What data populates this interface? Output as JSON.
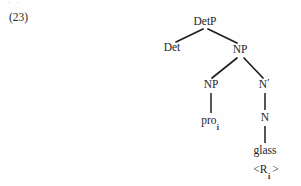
{
  "figure": {
    "example_number": "(23)",
    "scan_remnant": "· ·",
    "ink_color": "#1f1f1f",
    "page_background": "#fefefe"
  },
  "tree": {
    "type": "syntax-tree",
    "root": "DetP",
    "nodes": [
      {
        "id": "detp",
        "label": "DetP",
        "x": 205,
        "y": 22,
        "kind": "nonterminal"
      },
      {
        "id": "det",
        "label": "Det",
        "x": 172,
        "y": 48,
        "kind": "nonterminal"
      },
      {
        "id": "np1",
        "label": "NP",
        "x": 240,
        "y": 50,
        "kind": "nonterminal"
      },
      {
        "id": "np2",
        "label": "NP",
        "x": 211,
        "y": 85,
        "kind": "nonterminal"
      },
      {
        "id": "nbar",
        "label": "N",
        "x": 264,
        "y": 85,
        "kind": "nonterminal",
        "prime": "′"
      },
      {
        "id": "pro",
        "label": "pro",
        "x": 210,
        "y": 121,
        "kind": "terminal",
        "subscript": "i"
      },
      {
        "id": "n",
        "label": "N",
        "x": 265,
        "y": 118,
        "kind": "nonterminal"
      },
      {
        "id": "glass",
        "label": "glass",
        "x": 265,
        "y": 151,
        "kind": "terminal"
      },
      {
        "id": "rindex",
        "label": "<R",
        "x": 266,
        "y": 170,
        "kind": "annotation",
        "subscript": "i",
        "closing": ">"
      }
    ],
    "edges": [
      {
        "from": "detp",
        "to": "det",
        "x1": 203,
        "y1": 29,
        "x2": 176,
        "y2": 42,
        "style": "diagonal"
      },
      {
        "from": "detp",
        "to": "np1",
        "x1": 208,
        "y1": 29,
        "x2": 237,
        "y2": 43,
        "style": "diagonal"
      },
      {
        "from": "np1",
        "to": "np2",
        "x1": 237,
        "y1": 58,
        "x2": 212,
        "y2": 78,
        "style": "diagonal"
      },
      {
        "from": "np1",
        "to": "nbar",
        "x1": 244,
        "y1": 58,
        "x2": 263,
        "y2": 78,
        "style": "diagonal"
      },
      {
        "from": "np2",
        "to": "pro",
        "x1": 211,
        "y1": 93,
        "x2": 211,
        "y2": 113,
        "style": "vertical"
      },
      {
        "from": "nbar",
        "to": "n",
        "x1": 265,
        "y1": 93,
        "x2": 265,
        "y2": 110,
        "style": "vertical"
      },
      {
        "from": "n",
        "to": "glass",
        "x1": 265,
        "y1": 126,
        "x2": 265,
        "y2": 143,
        "style": "vertical"
      }
    ],
    "terminal_string": "pro i glass",
    "notes": "NP adjunct structure: Det + NP, inner NP = pro sub-i, sister N-bar dominating N 'glass' with index feature <R sub-i>"
  }
}
